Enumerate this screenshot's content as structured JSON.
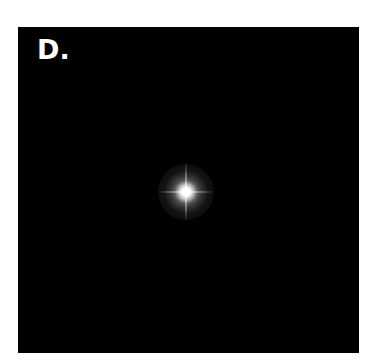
{
  "figure": {
    "panel_label": "D.",
    "background_color": "#000000",
    "star_color": "#ffffff"
  }
}
